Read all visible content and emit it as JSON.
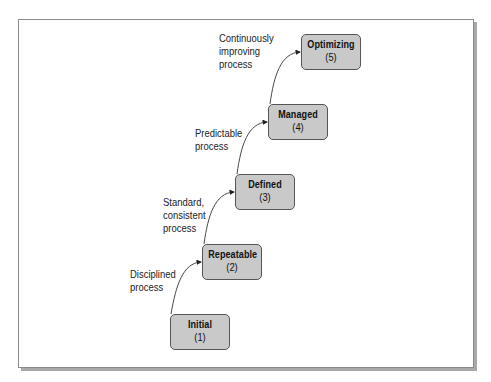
{
  "diagram": {
    "type": "staircase",
    "levels": [
      {
        "name": "Initial",
        "number": "(1)"
      },
      {
        "name": "Repeatable",
        "number": "(2)"
      },
      {
        "name": "Defined",
        "number": "(3)"
      },
      {
        "name": "Managed",
        "number": "(4)"
      },
      {
        "name": "Optimizing",
        "number": "(5)"
      }
    ],
    "transitions": [
      {
        "lines": [
          "Disciplined",
          "process"
        ]
      },
      {
        "lines": [
          "Standard,",
          "consistent",
          "process"
        ]
      },
      {
        "lines": [
          "Predictable",
          "process"
        ]
      },
      {
        "lines": [
          "Continuously",
          "improving",
          "process"
        ]
      }
    ],
    "colors": {
      "box_fill": "#c9c9c9",
      "box_border": "#555555",
      "frame_border": "#8a8a8a",
      "shadow": "#a8a8a8"
    }
  }
}
